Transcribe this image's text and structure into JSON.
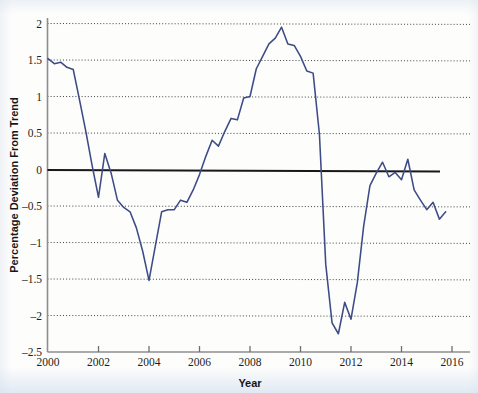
{
  "figure": {
    "background_color": "#fdfdfc",
    "line_color": "#3d4b86",
    "zero_line_color": "#18181c",
    "grid_color": "#1a1a1f"
  },
  "axes": {
    "x_title": "Year",
    "y_title": "Percentage Deviation From Trend",
    "x_ticks": [
      "2000",
      "2002",
      "2004",
      "2006",
      "2008",
      "2010",
      "2012",
      "2014",
      "2016"
    ],
    "y_ticks": [
      "2",
      "1.5",
      "1",
      "0.5",
      "0",
      "–0.5",
      "–1",
      "–1.5",
      "–2",
      "–2.5"
    ]
  },
  "chart_data": {
    "type": "line",
    "title": "",
    "xlabel": "Year",
    "ylabel": "Percentage Deviation From Trend",
    "xlim": [
      2000,
      2016.5
    ],
    "ylim": [
      -2.5,
      2.2
    ],
    "xticks": [
      2000,
      2002,
      2004,
      2006,
      2008,
      2010,
      2012,
      2014,
      2016
    ],
    "yticks": [
      -2.5,
      -2,
      -1.5,
      -1,
      -0.5,
      0,
      0.5,
      1,
      1.5,
      2
    ],
    "grid": "horizontal-dotted",
    "legend": "none",
    "annotations": [
      {
        "text": "zero reference line at y = 0",
        "y": 0
      }
    ],
    "series": [
      {
        "name": "Percentage Deviation From Trend",
        "color": "#3d4b86",
        "x": [
          2000.0,
          2000.25,
          2000.5,
          2000.75,
          2001.0,
          2001.25,
          2001.5,
          2001.75,
          2002.0,
          2002.25,
          2002.5,
          2002.75,
          2003.0,
          2003.25,
          2003.5,
          2003.75,
          2004.0,
          2004.25,
          2004.5,
          2004.75,
          2005.0,
          2005.25,
          2005.5,
          2005.75,
          2006.0,
          2006.25,
          2006.5,
          2006.75,
          2007.0,
          2007.25,
          2007.5,
          2007.75,
          2008.0,
          2008.25,
          2008.5,
          2008.75,
          2009.0,
          2009.25,
          2009.5,
          2009.75,
          2010.0,
          2010.25,
          2010.5,
          2010.75,
          2011.0,
          2011.25,
          2011.5,
          2011.75,
          2012.0,
          2012.25,
          2012.5,
          2012.75,
          2013.0,
          2013.25,
          2013.5,
          2013.75,
          2014.0,
          2014.25,
          2014.5,
          2014.75,
          2015.0,
          2015.25,
          2015.5,
          2015.75
        ],
        "y": [
          1.52,
          1.45,
          1.47,
          1.4,
          1.37,
          0.95,
          0.52,
          0.05,
          -0.38,
          0.22,
          -0.05,
          -0.42,
          -0.52,
          -0.58,
          -0.8,
          -1.12,
          -1.52,
          -1.05,
          -0.58,
          -0.55,
          -0.55,
          -0.42,
          -0.45,
          -0.28,
          -0.07,
          0.18,
          0.4,
          0.32,
          0.52,
          0.7,
          0.68,
          0.98,
          1.0,
          1.38,
          1.55,
          1.72,
          1.8,
          1.95,
          1.72,
          1.7,
          1.55,
          1.35,
          1.32,
          0.48,
          -1.3,
          -2.1,
          -2.25,
          -1.82,
          -2.05,
          -1.55,
          -0.78,
          -0.22,
          -0.05,
          0.1,
          -0.1,
          -0.04,
          -0.14,
          0.14,
          -0.28,
          -0.42,
          -0.55,
          -0.45,
          -0.68,
          -0.58
        ]
      }
    ]
  }
}
